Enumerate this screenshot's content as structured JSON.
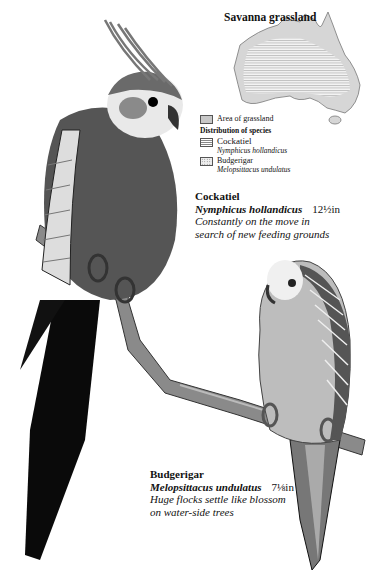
{
  "map": {
    "title": "Savanna grassland",
    "region": "Australia",
    "colors": {
      "grassland": "#c8c8c8",
      "outline": "#555555"
    }
  },
  "legend": {
    "items": [
      {
        "icon": "grassland-swatch-icon",
        "label": "Area of grassland"
      }
    ],
    "heading": "Distribution of species",
    "species": [
      {
        "icon": "cockatiel-hatch-swatch-icon",
        "label": "Cockatiel",
        "latin": "Nymphicus hollandicus"
      },
      {
        "icon": "budgerigar-dot-swatch-icon",
        "label": "Budgerigar",
        "latin": "Melopsittacus undulatus"
      }
    ]
  },
  "cockatiel": {
    "name": "Cockatiel",
    "latin": "Nymphicus hollandicus",
    "size": "12½in",
    "description_line1": "Constantly on the move in",
    "description_line2": "search of new feeding grounds"
  },
  "budgerigar": {
    "name": "Budgerigar",
    "latin": "Melopsittacus undulatus",
    "size": "7⅛in",
    "description_line1": "Huge flocks settle like blossom",
    "description_line2": "on water-side trees"
  }
}
